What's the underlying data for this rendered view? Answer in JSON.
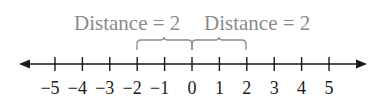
{
  "diagram": {
    "type": "number-line",
    "min": -5,
    "max": 5,
    "ticks": [
      "−5",
      "−4",
      "−3",
      "−2",
      "−1",
      "0",
      "1",
      "2",
      "3",
      "4",
      "5"
    ],
    "annotations": [
      {
        "label": "Distance = 2",
        "from": -2,
        "to": 0
      },
      {
        "label": "Distance = 2",
        "from": 0,
        "to": 2
      }
    ],
    "colors": {
      "axis": "#1a1a1a",
      "annotation": "#8a8a8a"
    }
  }
}
